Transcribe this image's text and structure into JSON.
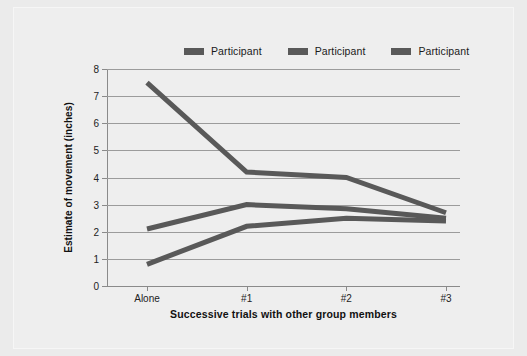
{
  "figure": {
    "background_color": "#eeeeee",
    "page_background_color": "#ebebeb"
  },
  "legend": {
    "position": "top-center",
    "entries": [
      {
        "label": "Participant",
        "color": "#595959",
        "icon": "line-swatch-icon"
      },
      {
        "label": "Participant",
        "color": "#595959",
        "icon": "line-swatch-icon"
      },
      {
        "label": "Participant",
        "color": "#595959",
        "icon": "line-swatch-icon"
      }
    ]
  },
  "chart_data": {
    "type": "line",
    "title": "",
    "xlabel": "Successive trials with other group members",
    "ylabel": "Estimate of movement (inches)",
    "categories": [
      "Alone",
      "#1",
      "#2",
      "#3"
    ],
    "x_tick_labels": [
      "Alone",
      "#1",
      "#2",
      "#3"
    ],
    "y_tick_labels": [
      "0",
      "1",
      "2",
      "3",
      "4",
      "5",
      "6",
      "7",
      "8"
    ],
    "ylim": [
      0,
      8
    ],
    "y_tick_step": 1,
    "grid": true,
    "grid_axis": "y",
    "legend_position": "top-center",
    "series": [
      {
        "name": "Participant",
        "color": "#595959",
        "values": [
          7.5,
          4.2,
          4.0,
          2.7
        ]
      },
      {
        "name": "Participant",
        "color": "#595959",
        "values": [
          2.1,
          3.0,
          2.85,
          2.5
        ]
      },
      {
        "name": "Participant",
        "color": "#595959",
        "values": [
          0.8,
          2.2,
          2.5,
          2.4
        ]
      }
    ]
  }
}
